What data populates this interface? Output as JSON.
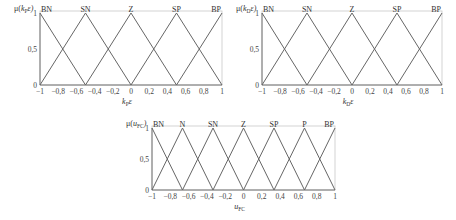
{
  "chart_data": [
    {
      "type": "line",
      "title": "",
      "ylabel": "μ(k_P ε)",
      "xlabel": "k_P ε",
      "xlim": [
        -1,
        1
      ],
      "ylim": [
        0,
        1
      ],
      "xticks": [
        "-1",
        "-0,8",
        "-0,6",
        "-0,4",
        "-0,2",
        "0",
        "0,2",
        "0,4",
        "0,6",
        "0,8",
        "1"
      ],
      "yticks": [
        "0",
        "0,5",
        "1"
      ],
      "grid": false,
      "series": [
        {
          "name": "BN",
          "x": [
            -1,
            -0.5
          ],
          "y": [
            1,
            0
          ]
        },
        {
          "name": "SN",
          "x": [
            -1,
            -0.5,
            0
          ],
          "y": [
            0,
            1,
            0
          ]
        },
        {
          "name": "Z",
          "x": [
            -0.5,
            0,
            0.5
          ],
          "y": [
            0,
            1,
            0
          ]
        },
        {
          "name": "SP",
          "x": [
            0,
            0.5,
            1
          ],
          "y": [
            0,
            1,
            0
          ]
        },
        {
          "name": "BP",
          "x": [
            0.5,
            1
          ],
          "y": [
            0,
            1
          ]
        }
      ]
    },
    {
      "type": "line",
      "title": "",
      "ylabel": "μ(k_D ε)",
      "xlabel": "k_D ε",
      "xlim": [
        -1,
        1
      ],
      "ylim": [
        0,
        1
      ],
      "xticks": [
        "-1",
        "-0,8",
        "-0,6",
        "-0,4",
        "-0,2",
        "0",
        "0,2",
        "0,4",
        "0,6",
        "0,8",
        "1"
      ],
      "yticks": [
        "0",
        "0,5",
        "1"
      ],
      "grid": false,
      "series": [
        {
          "name": "BN",
          "x": [
            -1,
            -0.5
          ],
          "y": [
            1,
            0
          ]
        },
        {
          "name": "SN",
          "x": [
            -1,
            -0.5,
            0
          ],
          "y": [
            0,
            1,
            0
          ]
        },
        {
          "name": "Z",
          "x": [
            -0.5,
            0,
            0.5
          ],
          "y": [
            0,
            1,
            0
          ]
        },
        {
          "name": "SP",
          "x": [
            0,
            0.5,
            1
          ],
          "y": [
            0,
            1,
            0
          ]
        },
        {
          "name": "BP",
          "x": [
            0.5,
            1
          ],
          "y": [
            0,
            1
          ]
        }
      ]
    },
    {
      "type": "line",
      "title": "",
      "ylabel": "μ(u_FC)",
      "xlabel": "u_FC",
      "xlim": [
        -1,
        1
      ],
      "ylim": [
        0,
        1
      ],
      "xticks": [
        "-1",
        "-0,8",
        "-0,6",
        "-0,4",
        "-0,2",
        "0",
        "0,2",
        "0,4",
        "0,6",
        "0,8",
        "1"
      ],
      "yticks": [
        "0",
        "0,5",
        "1"
      ],
      "grid": false,
      "series": [
        {
          "name": "BN",
          "x": [
            -1,
            -0.667
          ],
          "y": [
            1,
            0
          ]
        },
        {
          "name": "N",
          "x": [
            -1,
            -0.667,
            -0.333
          ],
          "y": [
            0,
            1,
            0
          ]
        },
        {
          "name": "SN",
          "x": [
            -0.667,
            -0.333,
            0
          ],
          "y": [
            0,
            1,
            0
          ]
        },
        {
          "name": "Z",
          "x": [
            -0.333,
            0,
            0.333
          ],
          "y": [
            0,
            1,
            0
          ]
        },
        {
          "name": "SP",
          "x": [
            0,
            0.333,
            0.667
          ],
          "y": [
            0,
            1,
            0
          ]
        },
        {
          "name": "P",
          "x": [
            0.333,
            0.667,
            1
          ],
          "y": [
            0,
            1,
            0
          ]
        },
        {
          "name": "BP",
          "x": [
            0.667,
            1
          ],
          "y": [
            0,
            1
          ]
        }
      ]
    }
  ],
  "panels": [
    {
      "ylabel_main": "μ(",
      "ylabel_var": "k",
      "ylabel_sub": "P",
      "ylabel_end": "ε)",
      "xlabel_var": "k",
      "xlabel_sub": "P",
      "xlabel_end": "ε"
    },
    {
      "ylabel_main": "μ(",
      "ylabel_var": "k",
      "ylabel_sub": "D",
      "ylabel_end": "ε)",
      "xlabel_var": "k",
      "xlabel_sub": "D",
      "xlabel_end": "ε"
    },
    {
      "ylabel_main": "μ(",
      "ylabel_var": "u",
      "ylabel_sub": "FC",
      "ylabel_end": ")",
      "xlabel_var": "u",
      "xlabel_sub": "FC",
      "xlabel_end": ""
    }
  ]
}
